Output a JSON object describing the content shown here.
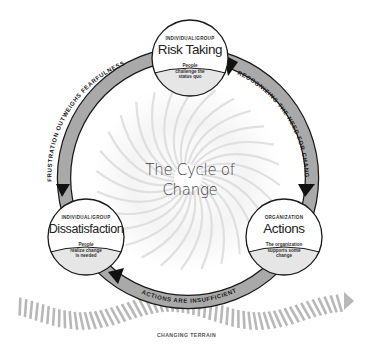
{
  "diagram": {
    "title_line1": "The Cycle of",
    "title_line2": "Change",
    "colors": {
      "band_fill": "#a9a9a9",
      "band_stroke": "#1a1a1a",
      "arrow_head": "#111111",
      "lower_fill": "#e6e6e6",
      "terrain": "#b8b8b8",
      "swirl": "#d4d4d4"
    },
    "nodes": [
      {
        "id": "risk-taking",
        "category": "INDIVIDUAL/GROUP",
        "title": "Risk Taking",
        "description_lines": [
          "People",
          "challenge the",
          "status quo"
        ]
      },
      {
        "id": "actions",
        "category": "ORGANIZATION",
        "title": "Actions",
        "description_lines": [
          "The organization",
          "supports some",
          "change"
        ]
      },
      {
        "id": "dissatisfaction",
        "category": "INDIVIDUAL/GROUP",
        "title": "Dissatisfaction",
        "description_lines": [
          "People",
          "realize change",
          "is needed"
        ]
      }
    ],
    "transitions": [
      {
        "from": "risk-taking",
        "to": "actions",
        "label": "RECOGNIZING THE NEED FOR CHANGE"
      },
      {
        "from": "actions",
        "to": "dissatisfaction",
        "label": "ACTIONS ARE INSUFFICIENT"
      },
      {
        "from": "dissatisfaction",
        "to": "risk-taking",
        "label": "FRUSTRATION OUTWEIGHS FEARFULNESS"
      }
    ],
    "terrain_label": "CHANGING TERRAIN"
  }
}
